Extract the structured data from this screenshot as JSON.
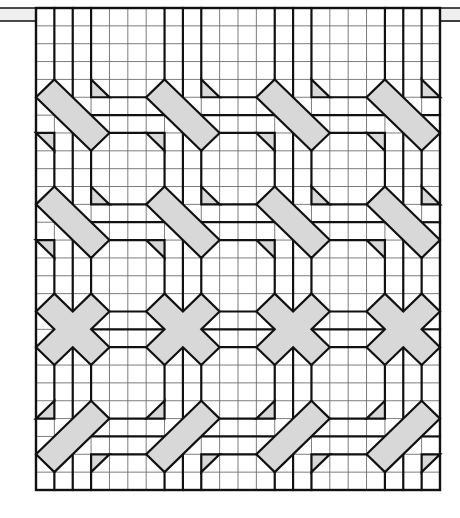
{
  "colors": {
    "background": "#ffffff",
    "motif_fill": "#d8d8d8",
    "rod_fill": "#efefef",
    "line": "#111111",
    "grid_line": "#6e6e6e"
  },
  "grid": {
    "left": 36,
    "top": 8,
    "right": 440,
    "bottom": 490,
    "columns": 22,
    "rows": 27
  },
  "rod": {
    "top": 8,
    "bottom": 21,
    "left": 0,
    "right": 460
  },
  "repeat": {
    "col_starts": [
      0,
      6,
      12,
      18
    ],
    "band_rows": [
      4,
      10,
      16,
      22
    ],
    "thick_col_offsets": [
      1,
      2,
      3
    ],
    "thick_row_offsets": [
      1,
      2,
      3
    ]
  },
  "bands": [
    {
      "name": "diagonal-down-band",
      "row": 4,
      "shapes": [
        {
          "name": "rectangle",
          "points": [
            [
              1,
              0
            ],
            [
              0,
              1
            ],
            [
              3,
              4
            ],
            [
              4,
              3
            ]
          ]
        },
        {
          "name": "triangle-upper",
          "points": [
            [
              3,
              0
            ],
            [
              3,
              1
            ],
            [
              4,
              1
            ]
          ]
        },
        {
          "name": "triangle-lower",
          "points": [
            [
              0,
              3
            ],
            [
              1,
              3
            ],
            [
              1,
              4
            ]
          ]
        }
      ]
    },
    {
      "name": "diagonal-down-band",
      "row": 10,
      "shapes": [
        {
          "name": "rectangle",
          "points": [
            [
              1,
              0
            ],
            [
              0,
              1
            ],
            [
              3,
              4
            ],
            [
              4,
              3
            ]
          ]
        },
        {
          "name": "triangle-upper",
          "points": [
            [
              3,
              0
            ],
            [
              3,
              1
            ],
            [
              4,
              1
            ]
          ]
        },
        {
          "name": "triangle-lower",
          "points": [
            [
              0,
              3
            ],
            [
              1,
              3
            ],
            [
              1,
              4
            ]
          ]
        }
      ]
    },
    {
      "name": "cross-band",
      "row": 16,
      "shapes": [
        {
          "name": "cross",
          "points": [
            [
              1,
              0
            ],
            [
              2,
              1
            ],
            [
              3,
              0
            ],
            [
              4,
              1
            ],
            [
              3,
              2
            ],
            [
              4,
              3
            ],
            [
              3,
              4
            ],
            [
              2,
              3
            ],
            [
              1,
              4
            ],
            [
              0,
              3
            ],
            [
              1,
              2
            ],
            [
              0,
              1
            ]
          ]
        }
      ]
    },
    {
      "name": "diagonal-up-band",
      "row": 22,
      "shapes": [
        {
          "name": "rectangle",
          "points": [
            [
              3,
              0
            ],
            [
              4,
              1
            ],
            [
              1,
              4
            ],
            [
              0,
              3
            ]
          ]
        },
        {
          "name": "triangle-upper",
          "points": [
            [
              0,
              1
            ],
            [
              1,
              0
            ],
            [
              1,
              1
            ]
          ]
        },
        {
          "name": "triangle-lower",
          "points": [
            [
              3,
              3
            ],
            [
              4,
              3
            ],
            [
              3,
              4
            ]
          ]
        }
      ]
    }
  ]
}
